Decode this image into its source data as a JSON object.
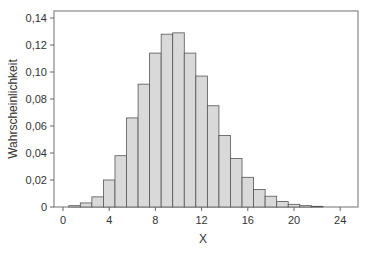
{
  "chart_data": {
    "type": "bar",
    "title": "",
    "xlabel": "X",
    "ylabel": "Wahrscheinlichkeit",
    "x": [
      1,
      2,
      3,
      4,
      5,
      6,
      7,
      8,
      9,
      10,
      11,
      12,
      13,
      14,
      15,
      16,
      17,
      18,
      19,
      20,
      21,
      22
    ],
    "values": [
      0.001,
      0.003,
      0.0075,
      0.02,
      0.038,
      0.066,
      0.091,
      0.114,
      0.128,
      0.129,
      0.114,
      0.097,
      0.075,
      0.053,
      0.036,
      0.022,
      0.013,
      0.008,
      0.004,
      0.002,
      0.001,
      0.0005
    ],
    "xlim": [
      -1,
      25.5
    ],
    "ylim": [
      0,
      0.145
    ],
    "xticks": [
      0,
      4,
      8,
      12,
      16,
      20,
      24
    ],
    "xtick_labels": [
      "0",
      "4",
      "8",
      "12",
      "16",
      "20",
      "24"
    ],
    "yticks": [
      0,
      0.02,
      0.04,
      0.06,
      0.08,
      0.1,
      0.12,
      0.14
    ],
    "ytick_labels": [
      "0",
      "0,02",
      "0,04",
      "0,06",
      "0,08",
      "0,10",
      "0,12",
      "0,14"
    ],
    "grid": false,
    "legend": null,
    "bar_fill": "#d9d9d9",
    "bar_edge": "#555555",
    "frame_color": "#888888"
  }
}
